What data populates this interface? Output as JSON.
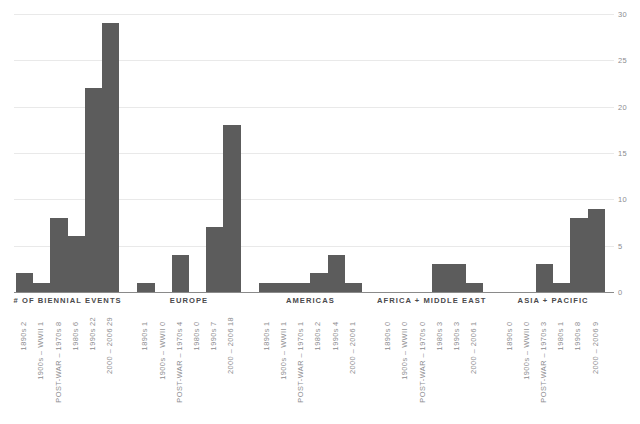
{
  "chart_data": {
    "type": "bar",
    "title": "",
    "xlabel": "",
    "ylabel": "",
    "ylim": [
      0,
      30
    ],
    "grid": true,
    "legend_position": "none",
    "y_axis_position": "right",
    "y_ticks": [
      0,
      5,
      10,
      15,
      20,
      25,
      30
    ],
    "categories": [
      "1890s",
      "1900s – WWII",
      "POST-WAR – 1970s",
      "1980s",
      "1990s",
      "2000 – 2006"
    ],
    "series": [
      {
        "name": "# OF BIENNIAL EVENTS",
        "values": [
          2,
          1,
          8,
          6,
          22,
          29
        ]
      },
      {
        "name": "EUROPE",
        "values": [
          1,
          0,
          4,
          0,
          7,
          18
        ]
      },
      {
        "name": "AMERICAS",
        "values": [
          1,
          1,
          1,
          2,
          4,
          1
        ]
      },
      {
        "name": "AFRICA + MIDDLE EAST",
        "values": [
          0,
          0,
          0,
          3,
          3,
          1
        ]
      },
      {
        "name": "ASIA + PACIFIC",
        "values": [
          0,
          0,
          3,
          1,
          8,
          9
        ]
      }
    ],
    "bar_color": "#5c5c5c",
    "grid_color": "#e9e9e9",
    "axis_color": "#8a8a8a",
    "label_color": "#8d8d8f"
  },
  "axis": {
    "ticks": [
      "0",
      "5",
      "10",
      "15",
      "20",
      "25",
      "30"
    ]
  },
  "groups": [
    {
      "title": "# OF BIENNIAL EVENTS",
      "ticks": [
        {
          "name": "1890s",
          "value": "2"
        },
        {
          "name": "1900s – WWII",
          "value": "1"
        },
        {
          "name": "POST-WAR – 1970s",
          "value": "8"
        },
        {
          "name": "1980s",
          "value": "6"
        },
        {
          "name": "1990s",
          "value": "22"
        },
        {
          "name": "2000 – 2006",
          "value": "29"
        }
      ]
    },
    {
      "title": "EUROPE",
      "ticks": [
        {
          "name": "1890s",
          "value": "1"
        },
        {
          "name": "1900s – WWII",
          "value": "0"
        },
        {
          "name": "POST-WAR – 1970s",
          "value": "4"
        },
        {
          "name": "1980s",
          "value": "0"
        },
        {
          "name": "1990s",
          "value": "7"
        },
        {
          "name": "2000 – 2006",
          "value": "18"
        }
      ]
    },
    {
      "title": "AMERICAS",
      "ticks": [
        {
          "name": "1890s",
          "value": "1"
        },
        {
          "name": "1900s – WWII",
          "value": "1"
        },
        {
          "name": "POST-WAR – 1970s",
          "value": "1"
        },
        {
          "name": "1980s",
          "value": "2"
        },
        {
          "name": "1990s",
          "value": "4"
        },
        {
          "name": "2000 – 2006",
          "value": "1"
        }
      ]
    },
    {
      "title": "AFRICA + MIDDLE EAST",
      "ticks": [
        {
          "name": "1890s",
          "value": "0"
        },
        {
          "name": "1900s – WWII",
          "value": "0"
        },
        {
          "name": "POST-WAR – 1970s",
          "value": "0"
        },
        {
          "name": "1980s",
          "value": "3"
        },
        {
          "name": "1990s",
          "value": "3"
        },
        {
          "name": "2000 – 2006",
          "value": "1"
        }
      ]
    },
    {
      "title": "ASIA + PACIFIC",
      "ticks": [
        {
          "name": "1890s",
          "value": "0"
        },
        {
          "name": "1900s – WWII",
          "value": "0"
        },
        {
          "name": "POST-WAR – 1970s",
          "value": "3"
        },
        {
          "name": "1980s",
          "value": "1"
        },
        {
          "name": "1990s",
          "value": "8"
        },
        {
          "name": "2000 – 2006",
          "value": "9"
        }
      ]
    }
  ]
}
